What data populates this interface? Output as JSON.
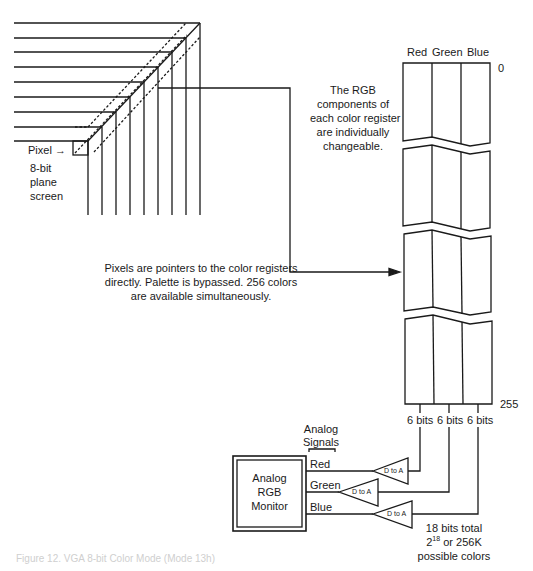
{
  "diagram": {
    "pixel_label": "Pixel →",
    "screen_label": [
      "8-bit",
      "plane",
      "screen"
    ],
    "rgb_note": [
      "The RGB",
      "components of",
      "each color register",
      "are individually",
      "changeable."
    ],
    "pointer_note": [
      "Pixels are pointers to the color registers",
      "directly.  Palette is bypassed.  256 colors",
      "are available simultaneously."
    ],
    "register_headers": {
      "red": "Red",
      "green": "Green",
      "blue": "Blue"
    },
    "register_index_top": "0",
    "register_index_bottom": "255",
    "bit_labels": [
      "6 bits",
      "6 bits",
      "6 bits"
    ],
    "analog_signals_label": [
      "Analog",
      "Signals"
    ],
    "signal_labels": [
      "Red",
      "Green",
      "Blue"
    ],
    "dac_label": "D to A",
    "monitor_label": [
      "Analog",
      "RGB",
      "Monitor"
    ],
    "total_note": {
      "line1": "18 bits total",
      "line2_base": "2",
      "line2_exp": "18",
      "line2_rest": " or 256K",
      "line3": "possible colors"
    },
    "caption": "Figure 12. VGA 8-bit Color Mode (Mode 13h)"
  }
}
